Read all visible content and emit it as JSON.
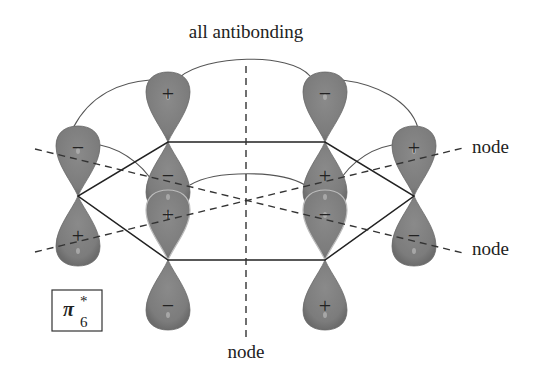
{
  "title": "all antibonding",
  "orbital_label": {
    "symbol": "π",
    "superscript": "*",
    "subscript": "6"
  },
  "node_labels": [
    "node",
    "node",
    "node"
  ],
  "colors": {
    "lobe": "#7e7e7e",
    "lobe_edge": "#6a6a6a",
    "line": "#222222",
    "arc": "#444444"
  },
  "atoms": [
    {
      "id": "top-left",
      "x": 168,
      "y": 142,
      "upper_sign": "+",
      "lower_sign": "−"
    },
    {
      "id": "top-right",
      "x": 325,
      "y": 142,
      "upper_sign": "−",
      "lower_sign": "+"
    },
    {
      "id": "right",
      "x": 414,
      "y": 196,
      "upper_sign": "+",
      "lower_sign": "−"
    },
    {
      "id": "bottom-right",
      "x": 325,
      "y": 260,
      "upper_sign": "−",
      "lower_sign": "+"
    },
    {
      "id": "bottom-left",
      "x": 168,
      "y": 260,
      "upper_sign": "+",
      "lower_sign": "−"
    },
    {
      "id": "left",
      "x": 78,
      "y": 196,
      "upper_sign": "−",
      "lower_sign": "+"
    }
  ]
}
